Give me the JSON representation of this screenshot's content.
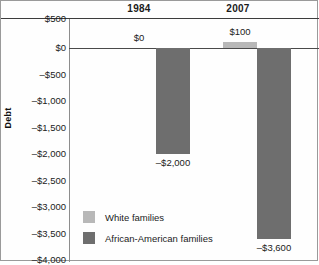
{
  "chart_data": {
    "type": "bar",
    "title": "",
    "xlabel": "",
    "ylabel": "Debt",
    "categories": [
      "1984",
      "2007"
    ],
    "series": [
      {
        "name": "White families",
        "values": [
          0,
          100
        ],
        "labels": [
          "$0",
          "$100"
        ],
        "color": "#b8b8b8"
      },
      {
        "name": "African-American families",
        "values": [
          -2000,
          -3600
        ],
        "labels": [
          "–$2,000",
          "–$3,600"
        ],
        "color": "#6e6e6e"
      }
    ],
    "ylim": [
      -4000,
      500
    ],
    "ytick_values": [
      500,
      0,
      -500,
      -1000,
      -1500,
      -2000,
      -2500,
      -3000,
      -3500,
      -4000
    ],
    "ytick_labels": [
      "$500",
      "$0",
      "–$500",
      "–$1,000",
      "–$1,500",
      "–$2,000",
      "–$2,500",
      "–$3,000",
      "–$3,500",
      "–$4,000"
    ],
    "grid": false,
    "legend_position": "inside-lower-left",
    "zero_line": true
  },
  "axis": {
    "y_title": "Debt"
  },
  "legend": {
    "entries": [
      {
        "label": "White families"
      },
      {
        "label": "African-American families"
      }
    ]
  }
}
